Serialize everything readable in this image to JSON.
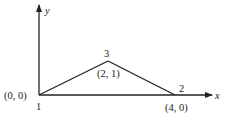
{
  "diagram": {
    "axes": {
      "x_label": "x",
      "y_label": "y"
    },
    "nodes": [
      {
        "id": "1",
        "label": "1",
        "coord": "(0, 0)"
      },
      {
        "id": "2",
        "label": "2",
        "coord": "(4, 0)"
      },
      {
        "id": "3",
        "label": "3",
        "coord": "(2, 1)"
      }
    ],
    "edges": [
      {
        "from": "1",
        "to": "3"
      },
      {
        "from": "3",
        "to": "2"
      },
      {
        "from": "1",
        "to": "2"
      }
    ],
    "colors": {
      "line": "#222222",
      "background": "#ffffff"
    }
  }
}
